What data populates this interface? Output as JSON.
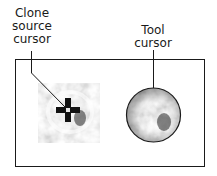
{
  "labels": {
    "clone_source": [
      "Clone",
      "source",
      "cursor"
    ],
    "tool": [
      "Tool",
      "cursor"
    ]
  },
  "colors": {
    "line": "#1a1a1a",
    "background": "#ffffff",
    "texture_light": "#e6e6e6",
    "texture_dark": "#5a5a5a"
  }
}
